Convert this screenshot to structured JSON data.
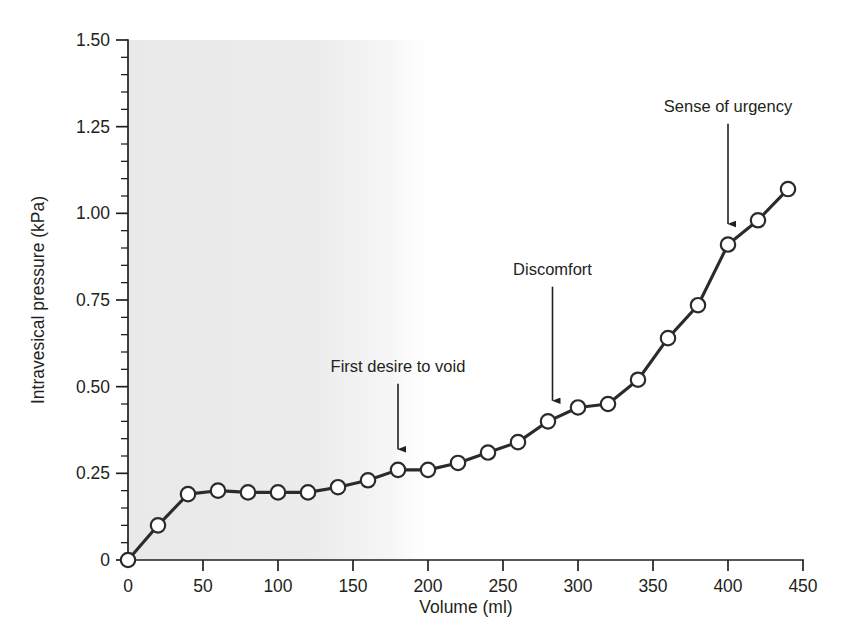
{
  "figure": {
    "background_color": "#ffffff",
    "line_color": "#2b2b2b",
    "marker_fill": "#ffffff",
    "shade_color": "#ebebeb"
  },
  "chart_data": {
    "type": "line",
    "title": "",
    "subtitle": "",
    "xlabel": "Volume (ml)",
    "ylabel": "Intravesical pressure (kPa)",
    "xlim": [
      0,
      450
    ],
    "ylim": [
      0,
      1.5
    ],
    "grid": false,
    "legend": "none",
    "x_ticks": [
      0,
      50,
      100,
      150,
      200,
      250,
      300,
      350,
      400,
      450
    ],
    "x_tick_labels": [
      "0",
      "50",
      "100",
      "150",
      "200",
      "250",
      "300",
      "350",
      "400",
      "450"
    ],
    "x_minor_step": 10,
    "y_ticks": [
      0,
      0.25,
      0.5,
      0.75,
      1.0,
      1.25,
      1.5
    ],
    "y_tick_labels": [
      "0",
      "0.25",
      "0.50",
      "0.75",
      "1.00",
      "1.25",
      "1.50"
    ],
    "y_minor_step": 0.05,
    "marker": "open-circle",
    "series": [
      {
        "name": "Cystometrogram",
        "x": [
          0,
          20,
          40,
          60,
          80,
          100,
          120,
          140,
          160,
          180,
          200,
          220,
          240,
          260,
          280,
          300,
          320,
          340,
          360,
          380,
          400,
          420,
          440
        ],
        "y": [
          0.0,
          0.1,
          0.19,
          0.2,
          0.195,
          0.195,
          0.195,
          0.21,
          0.23,
          0.26,
          0.26,
          0.28,
          0.31,
          0.34,
          0.4,
          0.44,
          0.45,
          0.52,
          0.64,
          0.735,
          0.91,
          0.98,
          1.07
        ]
      }
    ],
    "annotations": [
      {
        "label": "First desire to void",
        "x": 180,
        "y": 0.26,
        "text_x": 180,
        "text_y": 0.52,
        "arrow": "down"
      },
      {
        "label": "Discomfort",
        "x": 283,
        "y": 0.4,
        "text_x": 283,
        "text_y": 0.8,
        "arrow": "down"
      },
      {
        "label": "Sense of urgency",
        "x": 400,
        "y": 0.91,
        "text_x": 400,
        "text_y": 1.27,
        "arrow": "down"
      }
    ],
    "shaded_region": {
      "x_start": 0,
      "x_end": 205,
      "description": "light grey vertical band behind early filling phase"
    }
  }
}
